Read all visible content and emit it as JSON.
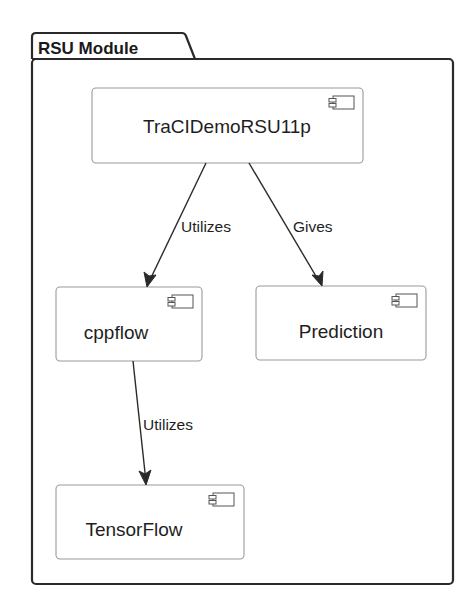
{
  "package": {
    "title": "RSU Module"
  },
  "components": [
    {
      "id": "tracidemorsu11p",
      "label": "TraCIDemoRSU11p",
      "icon": "uml-component-icon"
    },
    {
      "id": "cppflow",
      "label": "cppflow",
      "icon": "uml-component-icon"
    },
    {
      "id": "prediction",
      "label": "Prediction",
      "icon": "uml-component-icon"
    },
    {
      "id": "tensorflow",
      "label": "TensorFlow",
      "icon": "uml-component-icon"
    }
  ],
  "edges": [
    {
      "from": "TraCIDemoRSU11p",
      "to": "cppflow",
      "label": "Utilizes"
    },
    {
      "from": "TraCIDemoRSU11p",
      "to": "Prediction",
      "label": "Gives"
    },
    {
      "from": "cppflow",
      "to": "TensorFlow",
      "label": "Utilizes"
    }
  ],
  "colors": {
    "frame": "#2a2a2a",
    "component_border": "#9a9a9a",
    "background": "#ffffff",
    "text": "#1e1e1e"
  }
}
